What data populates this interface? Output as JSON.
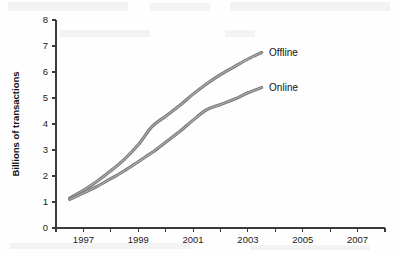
{
  "chart_data": {
    "type": "line",
    "title": "",
    "subtitle": "",
    "xlabel": "",
    "ylabel": "Billions of transactions",
    "xlim": [
      1996,
      2008
    ],
    "ylim": [
      0,
      8
    ],
    "grid": false,
    "legend_position": "right-inline-labels",
    "x_tick_labels": [
      "1997",
      "1999",
      "2001",
      "2003",
      "2005",
      "2007"
    ],
    "x_tick_values": [
      1997,
      1999,
      2001,
      2003,
      2005,
      2007
    ],
    "x_minor_tick_values": [
      1996,
      1998,
      2000,
      2002,
      2004,
      2006,
      2008
    ],
    "y_tick_labels": [
      "0",
      "1",
      "2",
      "3",
      "4",
      "5",
      "6",
      "7",
      "8"
    ],
    "y_tick_values": [
      0,
      1,
      2,
      3,
      4,
      5,
      6,
      7,
      8
    ],
    "series": [
      {
        "name": "Offline",
        "color": "#8c8c8c",
        "x": [
          1996.5,
          1997,
          1997.5,
          1998,
          1998.5,
          1999,
          1999.5,
          2000,
          2000.5,
          2001,
          2001.5,
          2002,
          2002.5,
          2003,
          2003.5
        ],
        "values": [
          1.15,
          1.45,
          1.8,
          2.2,
          2.65,
          3.2,
          3.9,
          4.3,
          4.7,
          5.15,
          5.55,
          5.9,
          6.2,
          6.5,
          6.75
        ]
      },
      {
        "name": "Online",
        "color": "#8c8c8c",
        "x": [
          1996.5,
          1997,
          1997.5,
          1998,
          1998.5,
          1999,
          1999.5,
          2000,
          2000.5,
          2001,
          2001.5,
          2002,
          2002.5,
          2003,
          2003.5
        ],
        "values": [
          1.1,
          1.35,
          1.6,
          1.9,
          2.2,
          2.55,
          2.9,
          3.3,
          3.7,
          4.15,
          4.55,
          4.75,
          4.95,
          5.2,
          5.4
        ]
      }
    ],
    "annotations": [
      {
        "text": "Offline",
        "x": 2003.7,
        "y": 6.75
      },
      {
        "text": "Online",
        "x": 2003.7,
        "y": 5.4
      }
    ]
  },
  "colors": {
    "line": "#8c8c8c",
    "line_edge": "#6f6f6f",
    "axis": "#3a3a3a",
    "text": "#111111",
    "background": "#fefefe"
  }
}
